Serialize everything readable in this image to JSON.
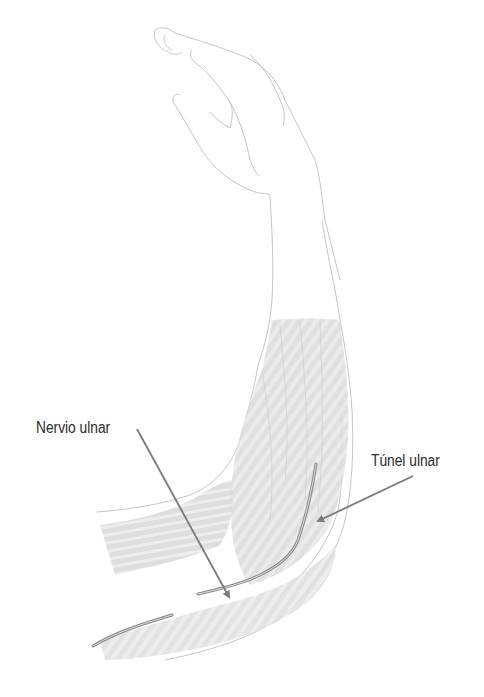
{
  "figure": {
    "colors": {
      "outline": "#c8c8c8",
      "muscle_fill": "#d6d6d6",
      "muscle_stripe": "#e6e6e6",
      "nerve": "#8a8a8a",
      "arrow": "#7a7a7a",
      "label_text": "#2a2a2a"
    }
  },
  "labels": {
    "nervio_ulnar": "Nervio ulnar",
    "tunel_ulnar": "Túnel ulnar"
  }
}
